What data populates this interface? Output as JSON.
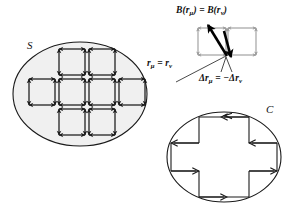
{
  "figure": {
    "type": "vector-diagram",
    "background": "#ffffff",
    "width": 301,
    "height": 214,
    "colors": {
      "stroke": "#1a1a1a",
      "ellipse_fill": "#f0f0f0",
      "inset_gray": "#9a9a9a",
      "bold_arrow": "#000000"
    },
    "labels": {
      "surface": "S",
      "contour": "C",
      "field_equality": "B(rμ) = B(rν)",
      "position_equality": "rμ = rν",
      "displacement_equality": "Δrμ = −Δrν"
    },
    "label_parts": {
      "B_head": "B",
      "B_lparen": "(",
      "B_vec1": "r",
      "B_sub1": "μ",
      "B_rparen": ")",
      "B_equals": " = ",
      "B_head2": "B",
      "B_vec2": "r",
      "B_sub2": "ν",
      "r_vec1": "r",
      "r_sub1": "μ",
      "r_equals": " = ",
      "r_vec2": "r",
      "r_sub2": "ν",
      "dr_delta1": "Δr",
      "dr_sub1": "μ",
      "dr_equals": " = −",
      "dr_delta2": "Δr",
      "dr_sub2": "ν"
    },
    "surface_region": {
      "name": "S",
      "shape": "ellipse",
      "cx": 80,
      "cy": 94,
      "rx": 67,
      "ry": 52,
      "tiling": {
        "cell": 26,
        "gap": 4,
        "orientation": "counterclockwise",
        "arrowheads": "double",
        "rows": [
          {
            "count": 2,
            "x0": 59,
            "y": 49
          },
          {
            "count": 4,
            "x0": 29,
            "y": 79
          },
          {
            "count": 2,
            "x0": 59,
            "y": 109
          }
        ],
        "total_cells": 8
      }
    },
    "contour_region": {
      "name": "C",
      "shape": "ellipse",
      "cx": 224,
      "cy": 157,
      "rx": 57,
      "ry": 45,
      "inner_shape": "cross",
      "orientation": "counterclockwise",
      "arrowheads": "single"
    },
    "inset": {
      "description": "two adjacent cells sharing an edge",
      "cells": 2,
      "shared_edge": "vertical",
      "bold_arrows": [
        "up-left",
        "down"
      ],
      "leader_line": true
    }
  }
}
